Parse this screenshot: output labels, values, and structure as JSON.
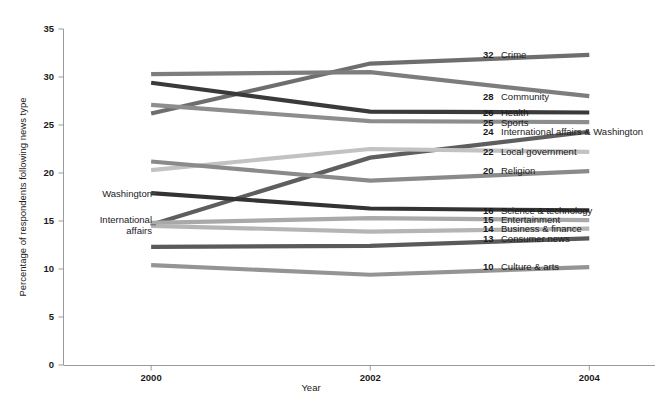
{
  "chart_data": {
    "type": "line",
    "title": "",
    "xlabel": "Year",
    "ylabel": "Percentage of respondents following news type",
    "x": [
      2000,
      2002,
      2004
    ],
    "xtick_labels": [
      "2000",
      "2002",
      "2004"
    ],
    "ytick_labels": [
      "0",
      "5",
      "10",
      "15",
      "20",
      "25",
      "30",
      "35"
    ],
    "yticks": [
      0,
      5,
      10,
      15,
      20,
      25,
      30,
      35
    ],
    "ylim": [
      0,
      35
    ],
    "xlim": [
      1999.2,
      2004.6
    ],
    "grid": false,
    "legend_position": "right-inline",
    "series": [
      {
        "name": "Crime",
        "end_value": 32,
        "label": "Crime",
        "values": [
          26.2,
          31.4,
          32.3
        ],
        "color": "#6e6e6e",
        "width": 4.2
      },
      {
        "name": "Community",
        "end_value": 28,
        "label": "Community",
        "values": [
          30.3,
          30.5,
          28.0
        ],
        "color": "#7d7d7d",
        "width": 4.2
      },
      {
        "name": "Health",
        "end_value": 26,
        "label": "Health",
        "values": [
          29.4,
          26.4,
          26.3
        ],
        "color": "#3a3a3a",
        "width": 4.2
      },
      {
        "name": "Sports",
        "end_value": 25,
        "label": "Sports",
        "values": [
          27.1,
          25.4,
          25.3
        ],
        "color": "#8d8d8d",
        "width": 4.2
      },
      {
        "name": "International affairs & Washington",
        "end_value": 24,
        "label": "International affairs & Washington",
        "values": [
          14.6,
          21.6,
          24.3
        ],
        "color": "#5e5e5e",
        "width": 4.2
      },
      {
        "name": "Local government",
        "end_value": 22,
        "label": "Local government",
        "values": [
          20.3,
          22.5,
          22.2
        ],
        "color": "#c2c2c2",
        "width": 4.2
      },
      {
        "name": "Religion",
        "end_value": 20,
        "label": "Religion",
        "values": [
          21.2,
          19.2,
          20.2
        ],
        "color": "#8a8a8a",
        "width": 4.2
      },
      {
        "name": "Science & technology",
        "end_value": 16,
        "label": "Science & technology",
        "values": [
          17.9,
          16.3,
          16.1
        ],
        "color": "#333333",
        "width": 4.2
      },
      {
        "name": "Entertainment",
        "end_value": 15,
        "label": "Entertainment",
        "values": [
          14.8,
          15.3,
          15.1
        ],
        "color": "#a9a9a9",
        "width": 4.2
      },
      {
        "name": "Business & finance",
        "end_value": 14,
        "label": "Business & finance",
        "values": [
          14.5,
          13.9,
          14.2
        ],
        "color": "#b5b5b5",
        "width": 4.2
      },
      {
        "name": "Consumer news",
        "end_value": 13,
        "label": "Consumer news",
        "values": [
          12.3,
          12.4,
          13.2
        ],
        "color": "#5a5a5a",
        "width": 4.2
      },
      {
        "name": "Culture & arts",
        "end_value": 10,
        "label": "Culture & arts",
        "values": [
          10.4,
          9.4,
          10.2
        ],
        "color": "#949494",
        "width": 4.2
      }
    ],
    "left_annotations": [
      {
        "name": "Washington",
        "text_lines": [
          "Washington"
        ],
        "value": 17.9
      },
      {
        "name": "International affairs",
        "text_lines": [
          "International",
          "affairs"
        ],
        "value": 14.6
      }
    ]
  }
}
